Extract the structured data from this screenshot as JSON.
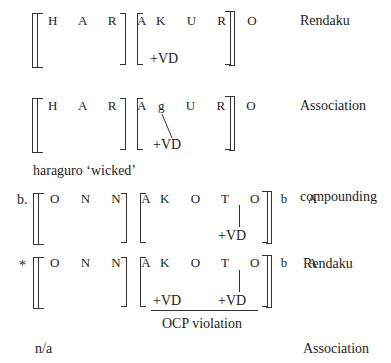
{
  "rows": [
    {
      "prefix": "",
      "left_segments": "HARA",
      "right_segments": "KURO",
      "features": [
        "+VD"
      ],
      "label": "Rendaku"
    },
    {
      "prefix": "",
      "left_segments": "HARA",
      "right_segments": "gURO",
      "features": [
        "+VD"
      ],
      "label": "Association",
      "gloss": "haraguro ‘wicked’"
    },
    {
      "prefix": "b.",
      "left_segments": "ONNA",
      "right_segments": "KOTObA",
      "features": [
        "+VD"
      ],
      "label": "compounding"
    },
    {
      "prefix": "*",
      "left_segments": "ONNA",
      "right_segments": "KOTObA",
      "features": [
        "+VD",
        "+VD"
      ],
      "label": "Rendaku",
      "note": "OCP violation"
    }
  ],
  "final": {
    "text": "n/a",
    "label": "Association"
  },
  "text": {
    "r1_left": "H A R A",
    "r1_right": "K U R O",
    "r1_vd": "+VD",
    "r1_label": "Rendaku",
    "r2_left": "H A R A",
    "r2_right": "g U R O",
    "r2_vd": "+VD",
    "r2_label": "Association",
    "gloss": "haraguro ‘wicked’",
    "r3_prefix": "b.",
    "r3_left": "O N N A",
    "r3_right": "K O T O b A",
    "r3_vd": "+VD",
    "r3_label": "compounding",
    "r4_prefix": "*",
    "r4_left": "O N N A",
    "r4_right": "K O T O b A",
    "r4_vd1": "+VD",
    "r4_vd2": "+VD",
    "r4_label": "Rendaku",
    "ocp": "OCP violation",
    "na": "n/a",
    "final_label": "Association"
  }
}
